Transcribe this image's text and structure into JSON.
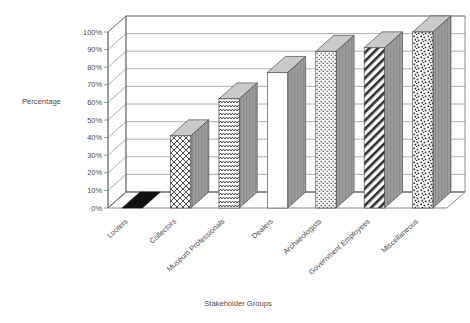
{
  "chart_data": {
    "type": "bar",
    "title": "",
    "subtitle": "",
    "xlabel": "Stakeholder Groups",
    "ylabel": "Percentage",
    "categories": [
      "Looters",
      "Collectors",
      "Museum Professionals",
      "Dealers",
      "Archaeologists",
      "Government Employees",
      "Miscellaneous"
    ],
    "values": [
      1,
      41,
      62,
      77,
      89,
      91,
      100
    ],
    "ylim": [
      0,
      100
    ],
    "ytick_labels": [
      "0%",
      "10%",
      "20%",
      "30%",
      "40%",
      "50%",
      "60%",
      "70%",
      "80%",
      "90%",
      "100%"
    ],
    "ytick_values": [
      0,
      10,
      20,
      30,
      40,
      50,
      60,
      70,
      80,
      90,
      100
    ],
    "grid": true,
    "legend": "none",
    "style": "3d-column-grayscale",
    "series": [
      {
        "name": "Percentage",
        "values": [
          1,
          41,
          62,
          77,
          89,
          91,
          100
        ],
        "patterns": [
          "solid-black",
          "basketweave",
          "zigzag",
          "blank-white",
          "dotted-rows",
          "diagonal-stripes",
          "speckle"
        ]
      }
    ],
    "annotations": []
  },
  "axis": {
    "y_title": "Percentage",
    "x_title": "Stakeholder Groups"
  },
  "colors": {
    "background": "#ffffff",
    "axis": "#5a5a5a",
    "grid": "#6e6e6e",
    "text": "#4a4a4a",
    "bar_outline": "#3d3d3d",
    "bar_side": "#9a9a9a",
    "bar_top": "#c9c9c9",
    "pattern_ink": "#2e2e2e"
  }
}
